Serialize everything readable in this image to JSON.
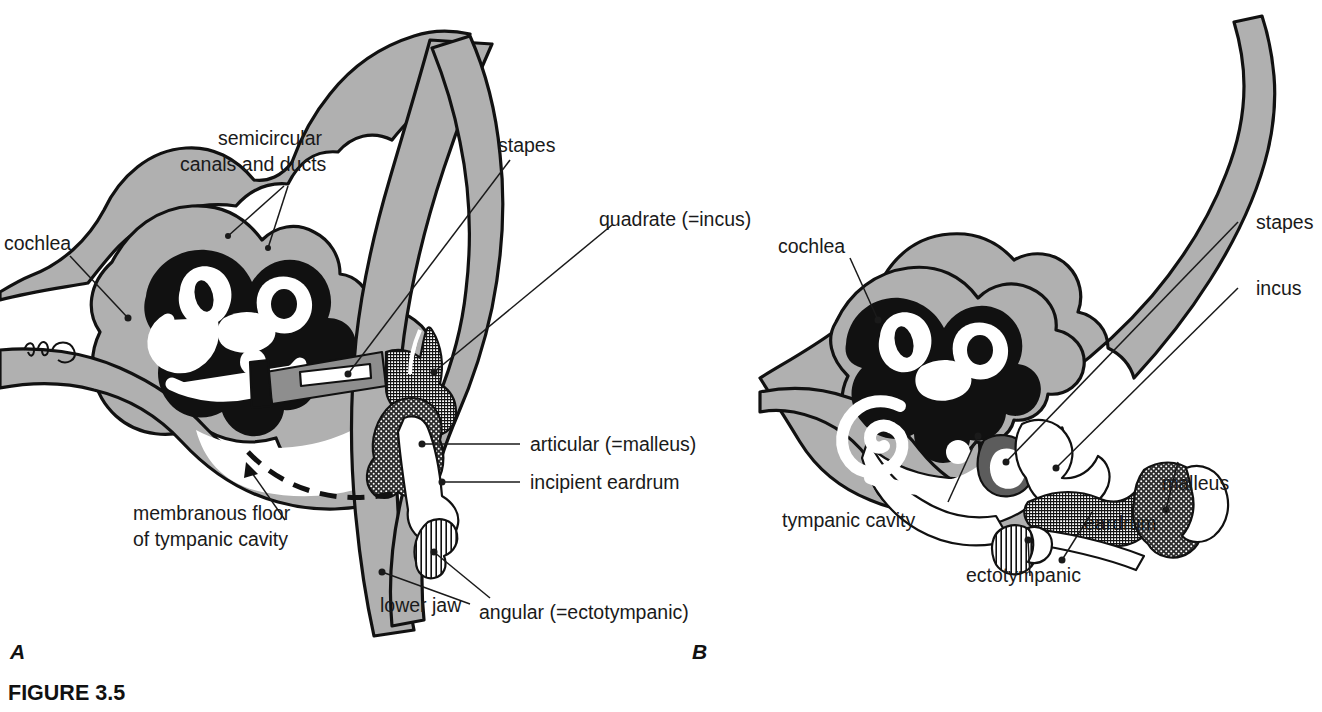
{
  "figure": {
    "caption": "FIGURE 3.5",
    "panels": [
      {
        "id": "A",
        "letter": "A"
      },
      {
        "id": "B",
        "letter": "B"
      }
    ]
  },
  "panel_a": {
    "letter": "A",
    "labels": {
      "semicircular_line1": "semicircular",
      "semicircular_line2": "canals and ducts",
      "cochlea": "cochlea",
      "stapes": "stapes",
      "quadrate": "quadrate (=incus)",
      "articular": "articular (=malleus)",
      "incipient_eardrum": "incipient eardrum",
      "membranous_line1": "membranous floor",
      "membranous_line2": "of tympanic cavity",
      "lower_jaw": "lower jaw",
      "angular": "angular (=ectotympanic)"
    }
  },
  "panel_b": {
    "letter": "B",
    "labels": {
      "cochlea": "cochlea",
      "stapes": "stapes",
      "incus": "incus",
      "malleus": "malleus",
      "eardrum": "eardrum",
      "ectotympanic": "ectotympanic",
      "tympanic_cavity": "tympanic cavity"
    }
  },
  "colors": {
    "bone_gray": "#b0b0b0",
    "outline_black": "#111111",
    "cavity_white": "#ffffff",
    "label_text": "#1a1a1a",
    "page_background": "#ffffff"
  }
}
